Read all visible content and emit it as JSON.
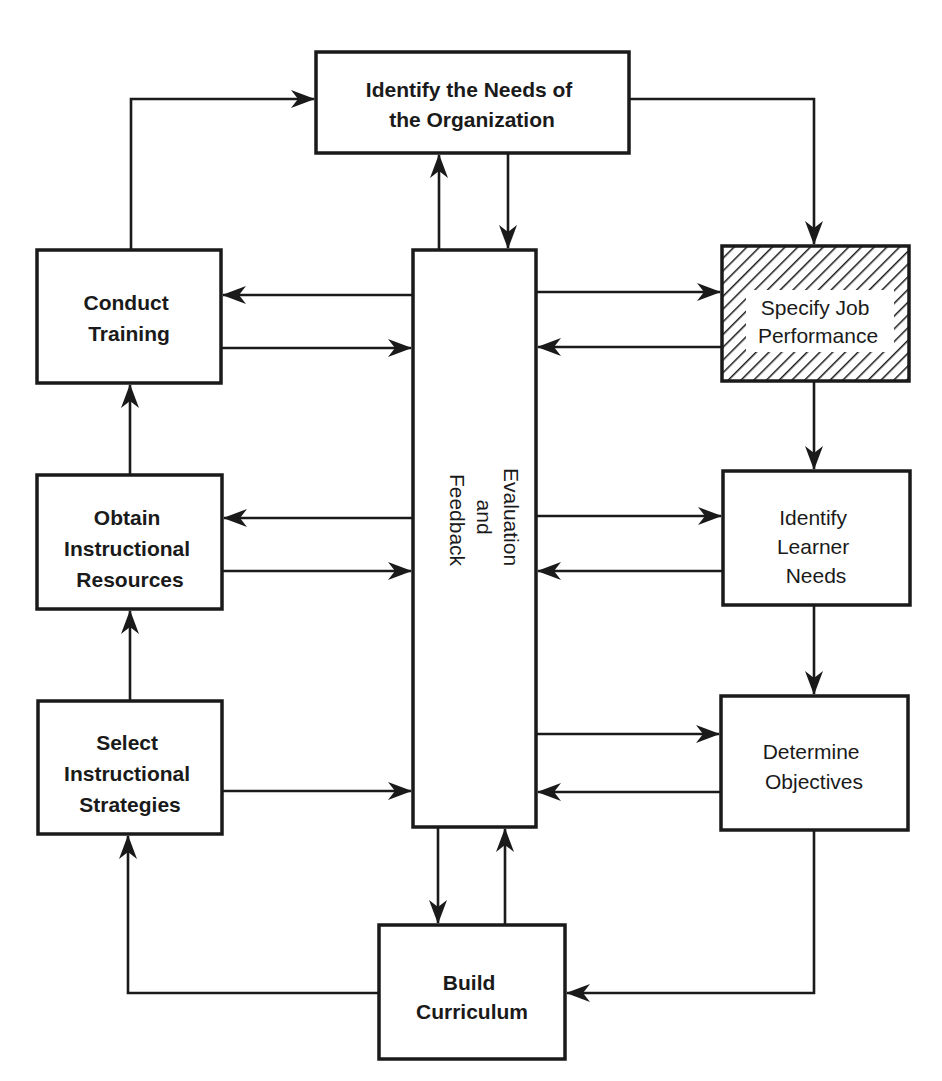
{
  "diagram": {
    "title": "",
    "colors": {
      "stroke": "#1a1a1a",
      "background": "#ffffff",
      "highlight_pattern": "diagonal-hatch"
    },
    "nodes": {
      "identify_org": {
        "lines": [
          "Identify the Needs of",
          "the Organization"
        ]
      },
      "conduct_training": {
        "lines": [
          "Conduct",
          "Training"
        ]
      },
      "obtain_resources": {
        "lines": [
          "Obtain",
          "Instructional",
          "Resources"
        ]
      },
      "select_strategies": {
        "lines": [
          "Select",
          "Instructional",
          "Strategies"
        ]
      },
      "evaluation": {
        "lines": [
          "Evaluation",
          "and",
          "Feedback"
        ]
      },
      "specify_job": {
        "lines": [
          "Specify Job",
          "Performance"
        ],
        "highlighted": true
      },
      "identify_learner": {
        "lines": [
          "Identify",
          "Learner",
          "Needs"
        ]
      },
      "determine_objectives": {
        "lines": [
          "Determine",
          "Objectives"
        ]
      },
      "build_curriculum": {
        "lines": [
          "Build",
          "Curriculum"
        ]
      }
    },
    "edges": [
      {
        "from": "conduct_training",
        "to": "identify_org"
      },
      {
        "from": "identify_org",
        "to": "specify_job"
      },
      {
        "from": "identify_org",
        "to": "evaluation"
      },
      {
        "from": "evaluation",
        "to": "identify_org"
      },
      {
        "from": "specify_job",
        "to": "identify_learner"
      },
      {
        "from": "identify_learner",
        "to": "determine_objectives"
      },
      {
        "from": "determine_objectives",
        "to": "build_curriculum"
      },
      {
        "from": "build_curriculum",
        "to": "select_strategies"
      },
      {
        "from": "select_strategies",
        "to": "obtain_resources"
      },
      {
        "from": "obtain_resources",
        "to": "conduct_training"
      },
      {
        "from": "evaluation",
        "to": "build_curriculum"
      },
      {
        "from": "build_curriculum",
        "to": "evaluation"
      },
      {
        "from": "evaluation",
        "to": "conduct_training"
      },
      {
        "from": "conduct_training",
        "to": "evaluation"
      },
      {
        "from": "evaluation",
        "to": "obtain_resources"
      },
      {
        "from": "obtain_resources",
        "to": "evaluation"
      },
      {
        "from": "select_strategies",
        "to": "evaluation"
      },
      {
        "from": "evaluation",
        "to": "specify_job"
      },
      {
        "from": "specify_job",
        "to": "evaluation"
      },
      {
        "from": "evaluation",
        "to": "identify_learner"
      },
      {
        "from": "identify_learner",
        "to": "evaluation"
      },
      {
        "from": "evaluation",
        "to": "determine_objectives"
      },
      {
        "from": "determine_objectives",
        "to": "evaluation"
      }
    ]
  }
}
